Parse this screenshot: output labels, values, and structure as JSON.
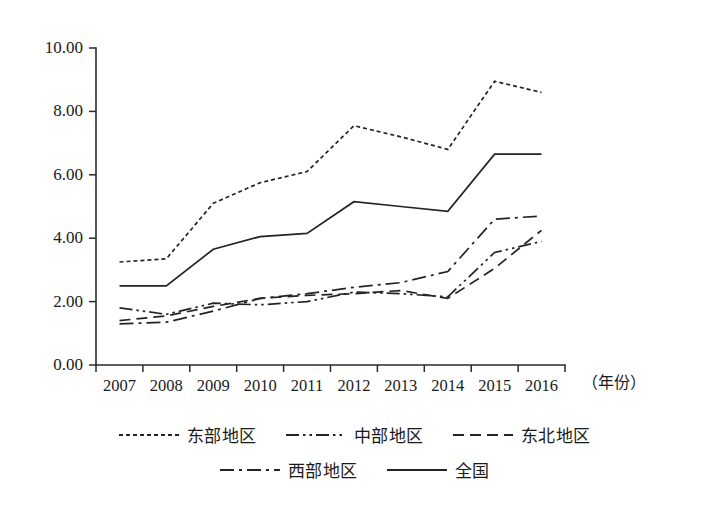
{
  "chart_data": {
    "type": "line",
    "title": "",
    "subtitle": "",
    "xlabel": "（年份）",
    "ylabel": "",
    "categories": [
      "2007",
      "2008",
      "2009",
      "2010",
      "2011",
      "2012",
      "2013",
      "2014",
      "2015",
      "2016"
    ],
    "ytick_labels": [
      "0.00",
      "2.00",
      "4.00",
      "6.00",
      "8.00",
      "10.00"
    ],
    "ytick_values": [
      0,
      2,
      4,
      6,
      8,
      10
    ],
    "ylim": [
      0,
      10
    ],
    "grid": false,
    "legend_position": "bottom",
    "series": [
      {
        "name": "东部地区",
        "style": "dotted",
        "dash": "4,3",
        "values": [
          3.25,
          3.35,
          5.1,
          5.75,
          6.1,
          7.55,
          7.2,
          6.8,
          8.95,
          8.6
        ]
      },
      {
        "name": "中部地区",
        "style": "dash-dot-dot",
        "dash": "13,4,2.5,4,2.5,4",
        "values": [
          1.8,
          1.6,
          1.95,
          1.9,
          2.0,
          2.3,
          2.25,
          2.15,
          3.55,
          3.9
        ]
      },
      {
        "name": "东北地区",
        "style": "dashed",
        "dash": "11,6",
        "values": [
          1.4,
          1.55,
          1.85,
          2.1,
          2.2,
          2.25,
          2.35,
          2.1,
          3.05,
          4.25
        ]
      },
      {
        "name": "西部地区",
        "style": "dash-dot",
        "dash": "14,5,3,5",
        "values": [
          1.3,
          1.35,
          1.7,
          2.1,
          2.25,
          2.45,
          2.6,
          2.95,
          4.6,
          4.7
        ]
      },
      {
        "name": "全国",
        "style": "solid",
        "dash": "",
        "values": [
          2.5,
          2.5,
          3.65,
          4.05,
          4.15,
          5.15,
          5.0,
          4.85,
          6.65,
          6.65
        ]
      }
    ]
  },
  "legend": {
    "rows": [
      [
        {
          "label": "东部地区",
          "swatch": "dotted"
        },
        {
          "label": "中部地区",
          "swatch": "dash-dot-dot"
        },
        {
          "label": "东北地区",
          "swatch": "dashed"
        }
      ],
      [
        {
          "label": "西部地区",
          "swatch": "dash-dot"
        },
        {
          "label": "全国",
          "swatch": "solid"
        }
      ]
    ]
  },
  "colors": {
    "ink": "#242424",
    "background": "#ffffff"
  }
}
